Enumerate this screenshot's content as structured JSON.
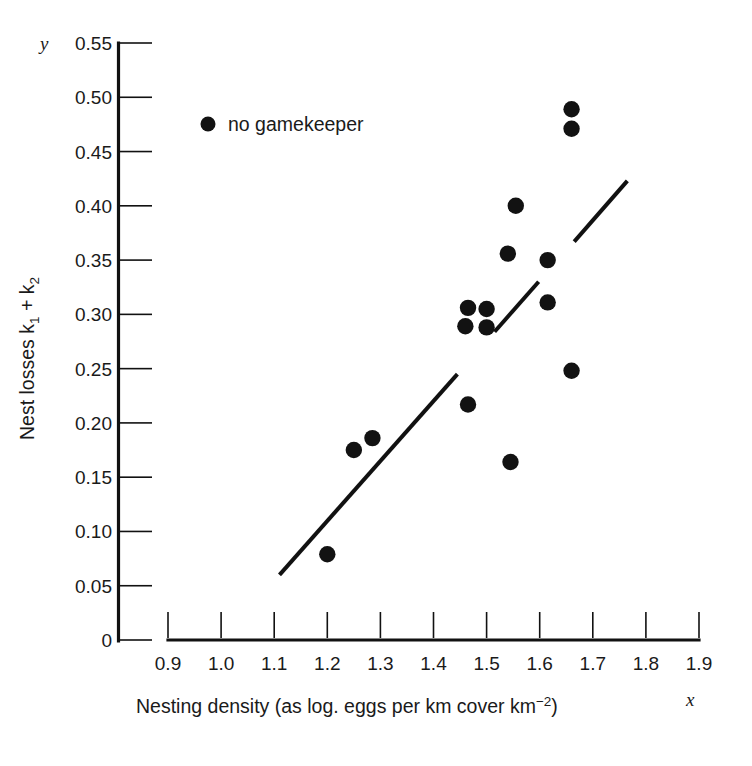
{
  "chart_data": {
    "type": "scatter",
    "title": "",
    "xlabel": "Nesting density (as log. eggs per km cover km",
    "xlabel_sup": "−2",
    "xlabel_tail": ")",
    "ylabel_prefix": "Nest losses k",
    "ylabel_sub1": "1",
    "ylabel_mid": " + k",
    "ylabel_sub2": "2",
    "x_axis_symbol": "x",
    "y_axis_symbol": "y",
    "xlim": [
      0.9,
      1.9
    ],
    "ylim": [
      0,
      0.55
    ],
    "xticks": [
      "0.9",
      "1.0",
      "1.1",
      "1.2",
      "1.3",
      "1.4",
      "1.5",
      "1.6",
      "1.7",
      "1.8",
      "1.9"
    ],
    "xtick_values": [
      0.9,
      1.0,
      1.1,
      1.2,
      1.3,
      1.4,
      1.5,
      1.6,
      1.7,
      1.8,
      1.9
    ],
    "yticks": [
      "0",
      "0.05",
      "0.10",
      "0.15",
      "0.20",
      "0.25",
      "0.30",
      "0.35",
      "0.40",
      "0.45",
      "0.50",
      "0.55"
    ],
    "ytick_values": [
      0,
      0.05,
      0.1,
      0.15,
      0.2,
      0.25,
      0.3,
      0.35,
      0.4,
      0.45,
      0.5,
      0.55
    ],
    "grid": false,
    "legend_position": "upper-left-inside",
    "series": [
      {
        "name": "no gamekeeper",
        "marker": "filled-circle",
        "color": "#121212",
        "points": [
          {
            "x": 1.2,
            "y": 0.079
          },
          {
            "x": 1.25,
            "y": 0.175
          },
          {
            "x": 1.285,
            "y": 0.186
          },
          {
            "x": 1.465,
            "y": 0.217
          },
          {
            "x": 1.46,
            "y": 0.289
          },
          {
            "x": 1.465,
            "y": 0.306
          },
          {
            "x": 1.5,
            "y": 0.305
          },
          {
            "x": 1.5,
            "y": 0.288
          },
          {
            "x": 1.545,
            "y": 0.164
          },
          {
            "x": 1.555,
            "y": 0.4
          },
          {
            "x": 1.54,
            "y": 0.356
          },
          {
            "x": 1.615,
            "y": 0.35
          },
          {
            "x": 1.615,
            "y": 0.311
          },
          {
            "x": 1.66,
            "y": 0.248
          },
          {
            "x": 1.66,
            "y": 0.489
          },
          {
            "x": 1.66,
            "y": 0.471
          }
        ]
      }
    ],
    "fit_line": {
      "name": "regression line",
      "x_start": 1.11,
      "y_start": 0.06,
      "x_end": 1.765,
      "y_end": 0.423,
      "segments": [
        {
          "x1": 1.11,
          "y1": 0.06,
          "x2": 1.445,
          "y2": 0.245
        },
        {
          "x1": 1.515,
          "y1": 0.284,
          "x2": 1.598,
          "y2": 0.33
        },
        {
          "x1": 1.665,
          "y1": 0.367,
          "x2": 1.765,
          "y2": 0.423
        }
      ]
    },
    "legend": [
      {
        "label": "no gamekeeper",
        "marker": "filled-circle",
        "color": "#121212"
      }
    ]
  }
}
